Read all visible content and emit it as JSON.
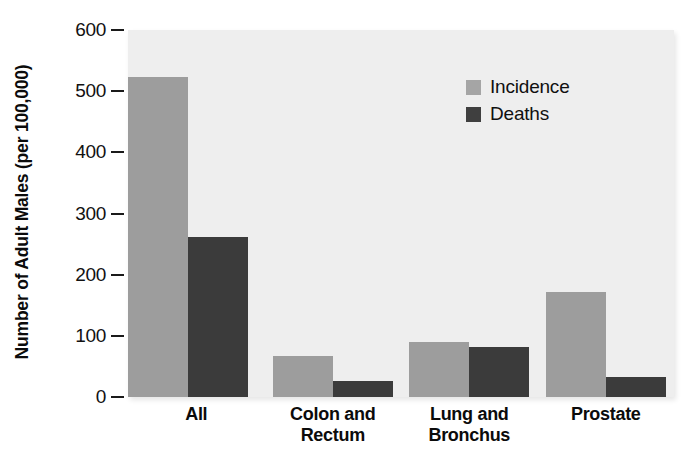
{
  "chart_data": {
    "type": "bar",
    "title": "",
    "xlabel": "",
    "ylabel": "Number of Adult Males (per 100,000)",
    "ylim": [
      0,
      600
    ],
    "yticks": [
      0,
      100,
      200,
      300,
      400,
      500,
      600
    ],
    "ytick_labels": [
      "0",
      "100",
      "200",
      "300",
      "400",
      "500",
      "600"
    ],
    "grid": false,
    "legend_position": "top-right",
    "categories": [
      "All",
      "Colon and Rectum",
      "Lung and Bronchus",
      "Prostate"
    ],
    "category_lines": [
      [
        "All"
      ],
      [
        "Colon and",
        "Rectum"
      ],
      [
        "Lung and",
        "Bronchus"
      ],
      [
        "Prostate"
      ]
    ],
    "series": [
      {
        "name": "Incidence",
        "color": "#9d9d9d",
        "values": [
          524,
          67,
          90,
          171
        ]
      },
      {
        "name": "Deaths",
        "color": "#3b3b3b",
        "values": [
          261,
          26,
          81,
          33
        ]
      }
    ]
  },
  "legend": {
    "items": [
      {
        "label": "Incidence",
        "swatch": "#a5a5a5"
      },
      {
        "label": "Deaths",
        "swatch": "#3f3f3f"
      }
    ]
  },
  "axes": {
    "y_title": "Number of Adult Males (per 100,000)"
  }
}
